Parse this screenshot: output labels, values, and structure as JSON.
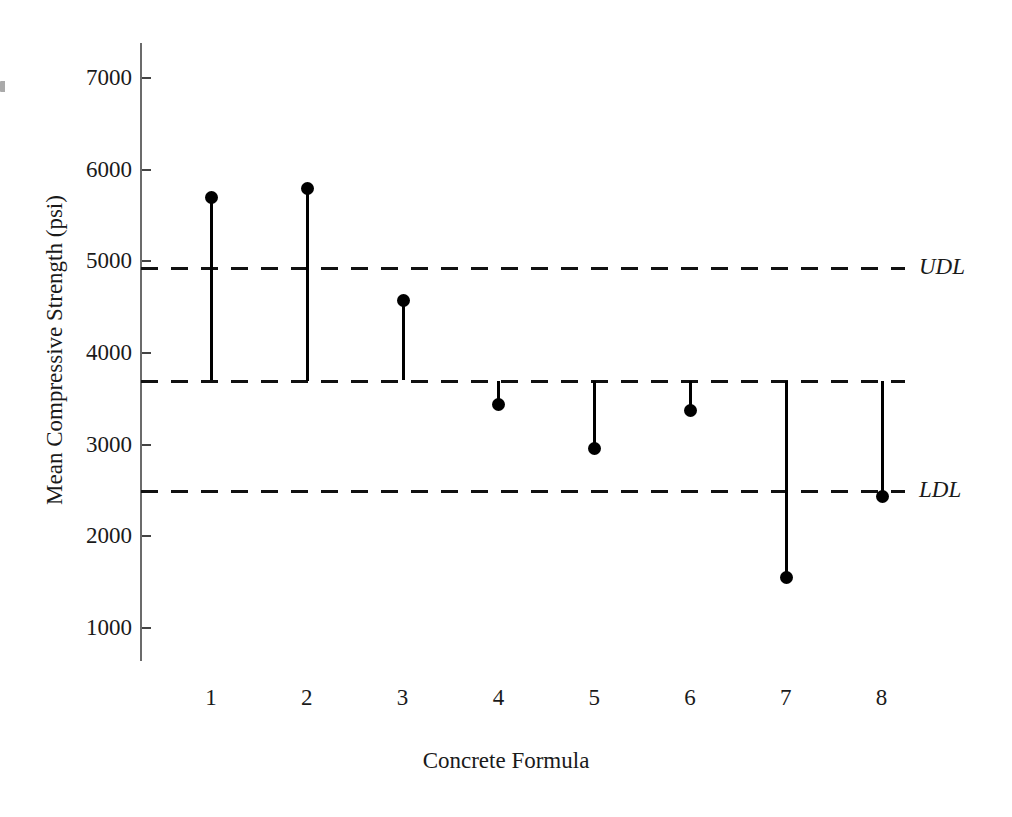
{
  "chart_data": {
    "type": "scatter",
    "title": "",
    "xlabel": "Concrete Formula",
    "ylabel": "Mean Compressive Strength (psi)",
    "categories": [
      "1",
      "2",
      "3",
      "4",
      "5",
      "6",
      "7",
      "8"
    ],
    "values": [
      5700,
      5800,
      4580,
      3445,
      2965,
      3380,
      1560,
      2440
    ],
    "series": [
      {
        "name": "Mean Compressive Strength",
        "values": [
          5700,
          5800,
          4580,
          3445,
          2965,
          3380,
          1560,
          2440
        ]
      }
    ],
    "ylim": [
      500,
      7400
    ],
    "xlim": [
      0.4,
      8.6
    ],
    "ytick_labels": [
      "7000",
      "6000",
      "5000",
      "4000",
      "3000",
      "2000",
      "1000"
    ],
    "yticks": [
      7000,
      6000,
      5000,
      4000,
      3000,
      2000,
      1000
    ],
    "xtick_labels": [
      "1",
      "2",
      "3",
      "4",
      "5",
      "6",
      "7",
      "8"
    ],
    "grid": false,
    "legend": "none",
    "marker": "filled-circle",
    "stem_baseline": 3700,
    "reference_lines": [
      {
        "label": "UDL",
        "value": 4930,
        "style": "dashed",
        "color": "#111111"
      },
      {
        "label": "",
        "value": 3700,
        "style": "dashed",
        "color": "#111111"
      },
      {
        "label": "LDL",
        "value": 2500,
        "style": "dashed",
        "color": "#111111"
      }
    ],
    "annotations": [
      {
        "text": "UDL",
        "value": 4930,
        "position": "right-outside"
      },
      {
        "text": "LDL",
        "value": 2500,
        "position": "right-outside"
      }
    ]
  },
  "colors": {
    "background": "#ffffff",
    "axis": "#6b6b6b",
    "mark": "#000000",
    "reference_line": "#111111",
    "text": "#1a1a1a"
  }
}
